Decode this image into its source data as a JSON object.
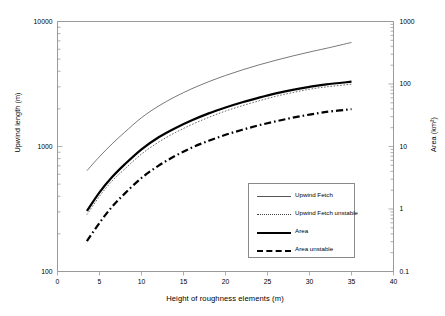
{
  "chart_data": {
    "type": "line",
    "title": "",
    "xlabel": "Height of roughness elements (m)",
    "ylabel": "Upwind length (m)",
    "y2label": "Area (km²)",
    "xlim": [
      0,
      40
    ],
    "xticks": [
      "0",
      "5",
      "10",
      "15",
      "20",
      "25",
      "30",
      "35",
      "40"
    ],
    "yscale": "log",
    "ylim": [
      100,
      10000
    ],
    "yticks": [
      "100",
      "1000",
      "10000"
    ],
    "y2scale": "log",
    "y2lim": [
      0.1,
      1000
    ],
    "y2ticks": [
      "0.1",
      "1",
      "10",
      "100",
      "1000"
    ],
    "grid": false,
    "legend_position": "lower right",
    "series": [
      {
        "name": "Upwind Fetch",
        "style": "solid-thin",
        "axis": "left",
        "x": [
          3.5,
          5,
          6.5,
          8,
          10,
          12,
          14,
          16,
          18,
          20,
          22,
          24,
          26,
          28,
          30,
          32,
          35
        ],
        "values": [
          640,
          830,
          1050,
          1300,
          1700,
          2100,
          2500,
          2900,
          3300,
          3700,
          4100,
          4500,
          4900,
          5300,
          5700,
          6100,
          6800
        ]
      },
      {
        "name": "Upwind Fetch unstable",
        "style": "dotted",
        "axis": "left",
        "x": [
          3.5,
          5,
          6.5,
          8,
          10,
          12,
          14,
          16,
          18,
          20,
          22,
          24,
          26,
          28,
          30,
          32,
          35
        ],
        "values": [
          285,
          400,
          530,
          660,
          870,
          1080,
          1290,
          1500,
          1710,
          1920,
          2120,
          2320,
          2520,
          2700,
          2870,
          3000,
          3150
        ]
      },
      {
        "name": "Area",
        "style": "solid-thick",
        "axis": "left",
        "x": [
          3.5,
          5,
          6.5,
          8,
          10,
          12,
          14,
          16,
          18,
          20,
          22,
          24,
          26,
          28,
          30,
          32,
          35
        ],
        "values": [
          305,
          430,
          570,
          720,
          950,
          1180,
          1400,
          1620,
          1840,
          2050,
          2260,
          2460,
          2660,
          2840,
          3000,
          3140,
          3300
        ]
      },
      {
        "name": "Area unstable",
        "style": "dashdot-thick",
        "axis": "left",
        "x": [
          3.5,
          5,
          6.5,
          8,
          10,
          12,
          14,
          16,
          18,
          20,
          22,
          24,
          26,
          28,
          30,
          32,
          35
        ],
        "values": [
          175,
          245,
          330,
          420,
          560,
          700,
          840,
          980,
          1110,
          1240,
          1360,
          1480,
          1590,
          1700,
          1800,
          1890,
          1990
        ]
      }
    ]
  },
  "legend": {
    "items": [
      {
        "label": "Upwind Fetch"
      },
      {
        "label": "Upwind Fetch unstable"
      },
      {
        "label": "Area"
      },
      {
        "label": "Area unstable"
      }
    ]
  }
}
